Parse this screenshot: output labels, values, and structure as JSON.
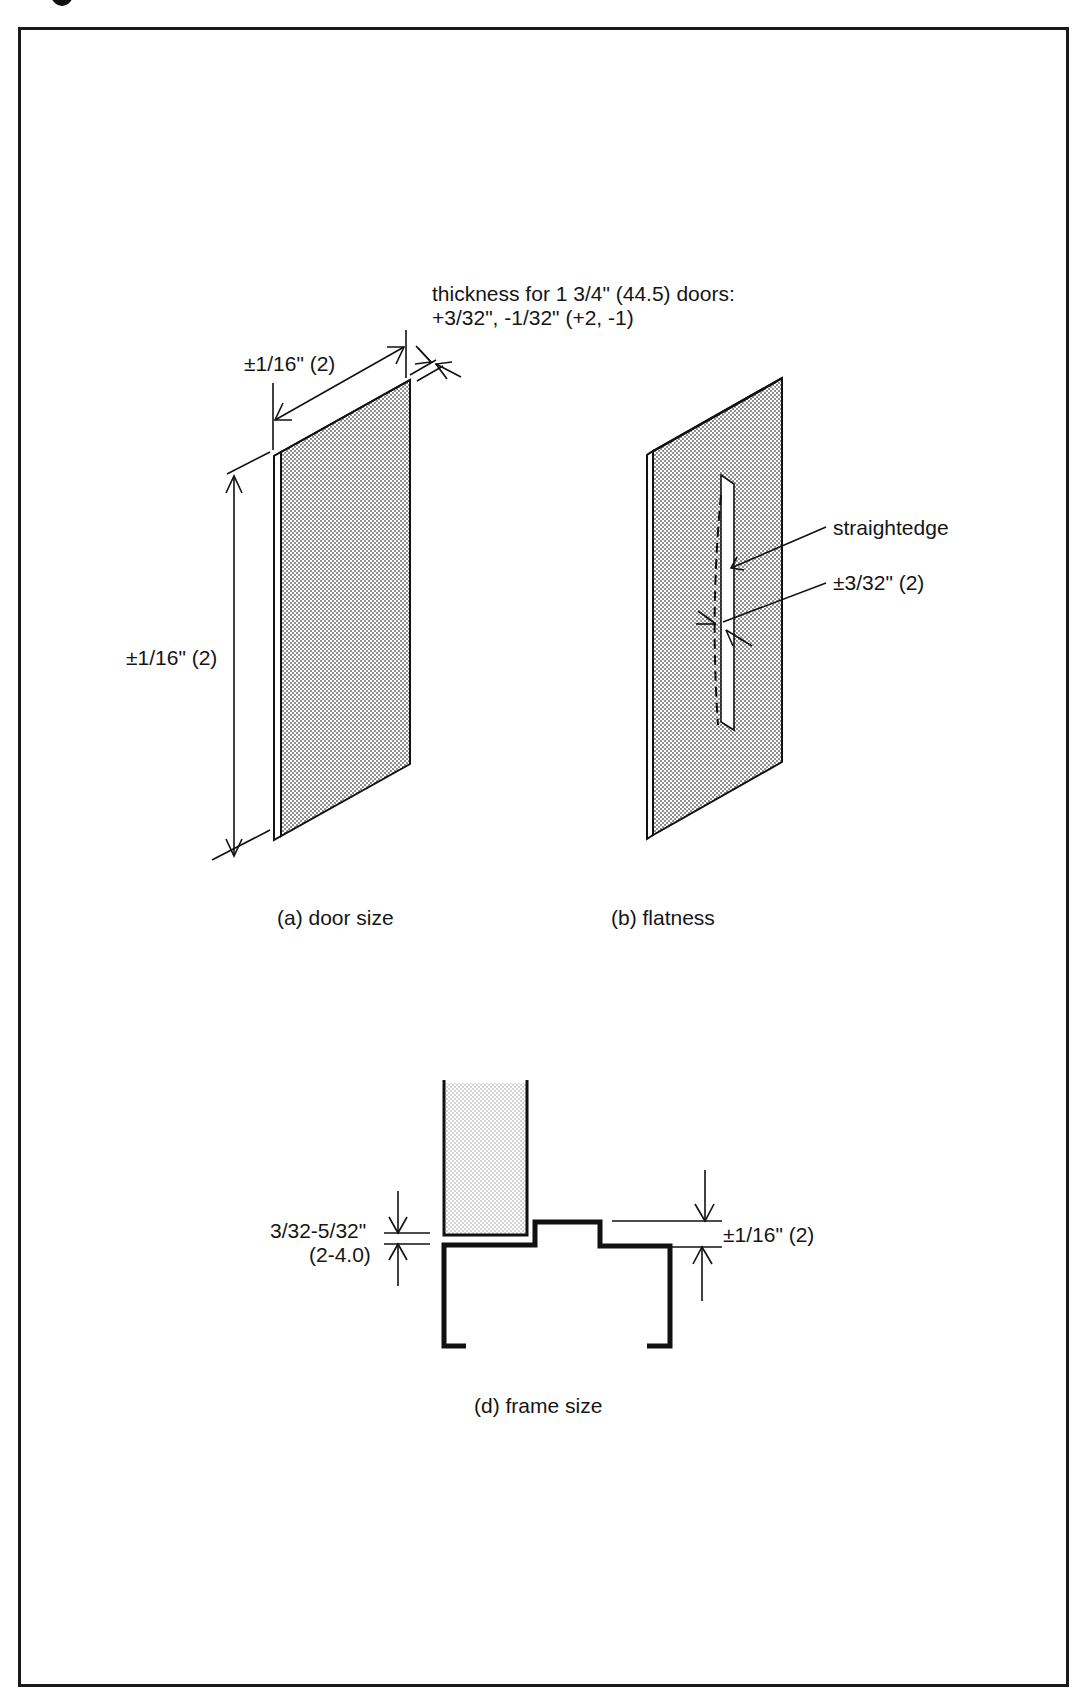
{
  "figure": {
    "title_fragment": "",
    "panels": [
      {
        "id": "a",
        "caption": "(a) door size",
        "annotations": {
          "width_tolerance": "±1/16\" (2)",
          "height_tolerance": "±1/16\" (2)",
          "thickness_line1": "thickness for 1 3/4\" (44.5) doors:",
          "thickness_line2": "+3/32\", -1/32\" (+2, -1)"
        }
      },
      {
        "id": "b",
        "caption": "(b) flatness",
        "annotations": {
          "straightedge": "straightedge",
          "flatness_tolerance": "±3/32\" (2)"
        }
      },
      {
        "id": "d",
        "caption": "(d) frame size",
        "annotations": {
          "clearance_line1": "3/32-5/32\"",
          "clearance_line2": "(2-4.0)",
          "frame_tolerance": "±1/16\" (2)"
        }
      }
    ],
    "colors": {
      "line": "#111111",
      "fill_stipple": "#d9d9d9",
      "background": "#ffffff"
    }
  }
}
